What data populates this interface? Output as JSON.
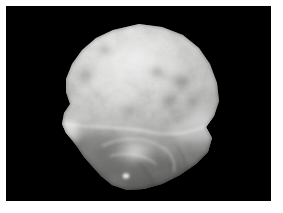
{
  "image": {
    "kind": "photograph",
    "subject_label": "irregular rounded rock specimen",
    "background_color": "#000000",
    "page_margin_color": "#ffffff",
    "color_mode": "grayscale",
    "frame": {
      "x": 6,
      "y": 6,
      "width": 265,
      "height": 195
    },
    "canvas_size": {
      "width": 283,
      "height": 213
    },
    "specimen": {
      "bounds": {
        "x": 62,
        "y": 24,
        "width": 158,
        "height": 166
      },
      "center": {
        "x": 139,
        "y": 105
      },
      "tone_light": "#f2f2f0",
      "tone_mid": "#b9b9b6",
      "tone_dark": "#6e6e6c",
      "tone_shadow": "#3a3a39",
      "highlight_top": {
        "x": 140,
        "y": 52
      },
      "highlight_right_rim": {
        "x": 205,
        "y": 118
      },
      "highlight_left_notch": {
        "x": 74,
        "y": 128
      },
      "bright_spot_bottom": {
        "x": 126,
        "y": 176
      },
      "outline_points": "139,24 162,27 183,35 199,48 210,64 217,83 219,101 214,116 206,127 212,138 208,152 196,164 180,175 162,184 144,189 127,190 112,185 101,176 92,166 84,157 78,148 72,140 66,133 62,124 64,113 70,104 66,92 66,79 72,64 82,50 96,38 113,30"
    }
  }
}
